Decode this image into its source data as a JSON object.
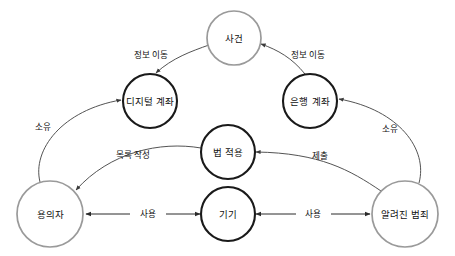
{
  "diagram": {
    "type": "node-link-graph",
    "language": "ko",
    "background_color": "#ffffff",
    "colors": {
      "node_dark_stroke": "#1a1a1a",
      "node_light_stroke": "#9a9a9a",
      "edge_stroke": "#2b2b2b",
      "label_text": "#111111",
      "node_fill": "#ffffff"
    },
    "nodes": [
      {
        "id": "incident",
        "label": "사건",
        "style": "light",
        "cx": 234,
        "cy": 38,
        "r": 27
      },
      {
        "id": "digital-account",
        "label": "디지털 계좌",
        "style": "dark",
        "cx": 150,
        "cy": 101,
        "r": 27
      },
      {
        "id": "bank-account",
        "label": "은행 계좌",
        "style": "dark",
        "cx": 310,
        "cy": 101,
        "r": 27
      },
      {
        "id": "law-application",
        "label": "법 적용",
        "style": "dark",
        "cx": 228,
        "cy": 152,
        "r": 27
      },
      {
        "id": "suspect",
        "label": "용의자",
        "style": "light",
        "cx": 50,
        "cy": 214,
        "r": 33
      },
      {
        "id": "device",
        "label": "기기",
        "style": "dark",
        "cx": 228,
        "cy": 214,
        "r": 27
      },
      {
        "id": "known-crime",
        "label": "알려진 범죄",
        "style": "light",
        "cx": 405,
        "cy": 214,
        "r": 33
      }
    ],
    "edges": [
      {
        "id": "incident-to-digital-account",
        "label": "정보 이동",
        "from": "incident",
        "to": "digital-account",
        "direction": "one-way",
        "label_x": 151,
        "label_y": 55
      },
      {
        "id": "bank-account-to-incident",
        "label": "정보 이동",
        "from": "bank-account",
        "to": "incident",
        "direction": "one-way",
        "label_x": 308,
        "label_y": 55
      },
      {
        "id": "suspect-to-digital-account",
        "label": "소유",
        "from": "suspect",
        "to": "digital-account",
        "direction": "one-way",
        "label_x": 43,
        "label_y": 127
      },
      {
        "id": "known-crime-to-bank-account",
        "label": "소유",
        "from": "known-crime",
        "to": "bank-account",
        "direction": "one-way",
        "label_x": 390,
        "label_y": 129
      },
      {
        "id": "law-application-to-suspect",
        "label": "목록 작성",
        "from": "law-application",
        "to": "suspect",
        "direction": "one-way",
        "label_x": 133,
        "label_y": 155
      },
      {
        "id": "known-crime-to-law-application",
        "label": "제출",
        "from": "known-crime",
        "to": "law-application",
        "direction": "one-way",
        "label_x": 320,
        "label_y": 156
      },
      {
        "id": "suspect-device-use",
        "label": "사용",
        "from": "suspect",
        "to": "device",
        "direction": "two-way",
        "label_x": 148,
        "label_y": 214
      },
      {
        "id": "device-known-crime-use",
        "label": "사용",
        "from": "device",
        "to": "known-crime",
        "direction": "two-way",
        "label_x": 313,
        "label_y": 214
      }
    ]
  }
}
